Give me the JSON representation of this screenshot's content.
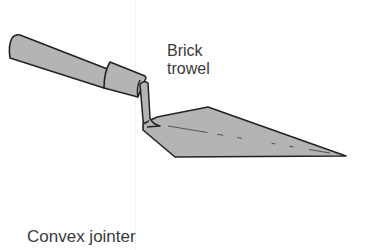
{
  "figure": {
    "tools": [
      {
        "name": "Brick trowel",
        "label_lines": [
          "Brick",
          "trowel"
        ],
        "icon": "brick-trowel-illustration"
      },
      {
        "name": "Convex jointer",
        "label_lines": [
          "Convex jointer"
        ],
        "icon": "convex-jointer-illustration"
      }
    ],
    "colors": {
      "fill": "#b4b4b4",
      "outline": "#222222",
      "label_text": "#3a3a3a",
      "background": "#ffffff"
    }
  }
}
